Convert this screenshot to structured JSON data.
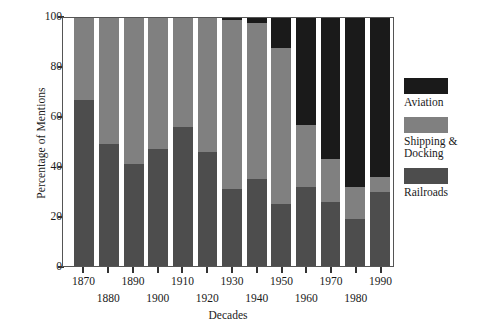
{
  "chart_data": {
    "type": "bar",
    "stacked": true,
    "stack_mode": "percent",
    "title": "",
    "xlabel": "Decades",
    "ylabel": "Percentage of Mentions",
    "ylim": [
      0,
      100
    ],
    "yticks": [
      0,
      20,
      40,
      60,
      80,
      100
    ],
    "grid": false,
    "legend_position": "right",
    "categories": [
      "1870",
      "1880",
      "1890",
      "1900",
      "1910",
      "1920",
      "1930",
      "1940",
      "1950",
      "1960",
      "1970",
      "1980",
      "1990"
    ],
    "series": [
      {
        "name": "Railroads",
        "color": "#4d4d4d",
        "values": [
          67,
          49,
          41,
          47,
          56,
          46,
          31,
          35,
          25,
          32,
          26,
          19,
          30
        ]
      },
      {
        "name": "Shipping & Docking",
        "color": "#808080",
        "values": [
          33,
          51,
          59,
          53,
          44,
          54,
          68,
          63,
          63,
          25,
          17,
          13,
          6
        ]
      },
      {
        "name": "Aviation",
        "color": "#1a1a1a",
        "values": [
          0,
          0,
          0,
          0,
          0,
          0,
          1,
          2,
          12,
          43,
          57,
          68,
          64
        ]
      }
    ]
  },
  "axes": {
    "ylabel": "Percentage of Mentions",
    "xlabel": "Decades",
    "ytick_labels": [
      "0",
      "20",
      "40",
      "60",
      "80",
      "100"
    ],
    "xtick_labels": [
      "1870",
      "1880",
      "1890",
      "1900",
      "1910",
      "1920",
      "1930",
      "1940",
      "1950",
      "1960",
      "1970",
      "1980",
      "1990"
    ]
  },
  "legend": {
    "items": [
      {
        "label": "Aviation",
        "color": "#1a1a1a"
      },
      {
        "label": "Shipping &\nDocking",
        "color": "#808080"
      },
      {
        "label": "Railroads",
        "color": "#4d4d4d"
      }
    ]
  }
}
